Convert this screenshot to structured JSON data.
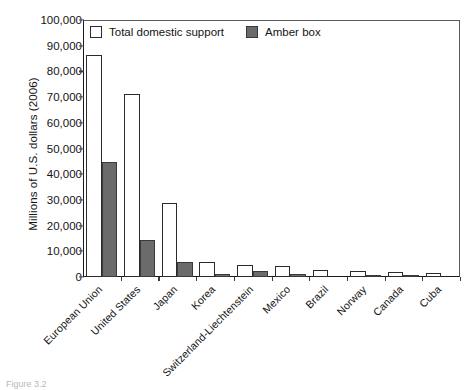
{
  "chart_data": {
    "type": "bar",
    "title": "",
    "xlabel": "",
    "ylabel": "Millions of U.S. dollars (2006)",
    "ylim": [
      0,
      100000
    ],
    "ytick_labels": [
      "100,000",
      "90,000",
      "80,000",
      "70,000",
      "60,000",
      "50,000",
      "40,000",
      "30,000",
      "20,000",
      "10,000",
      "0"
    ],
    "ytick_values": [
      100000,
      90000,
      80000,
      70000,
      60000,
      50000,
      40000,
      30000,
      20000,
      10000,
      0
    ],
    "grid": false,
    "legend_position": "top-left",
    "categories": [
      "European Union",
      "United States",
      "Japan",
      "Korea",
      "Switzerland-Liechtenstein",
      "Mexico",
      "Brazil",
      "Norway",
      "Canada",
      "Cuba"
    ],
    "series": [
      {
        "name": "Total domestic support",
        "color": "#ffffff",
        "values": [
          86500,
          71200,
          28900,
          6000,
          4800,
          4100,
          2900,
          2200,
          2000,
          1600
        ]
      },
      {
        "name": "Amber box",
        "color": "#6b6b6b",
        "values": [
          44700,
          14400,
          5900,
          1300,
          2200,
          1300,
          0,
          800,
          400,
          0
        ]
      }
    ]
  },
  "legend": {
    "items": [
      {
        "label": "Total domestic support",
        "swatch": "open-square-swatch"
      },
      {
        "label": "Amber box",
        "swatch": "filled-square-swatch"
      }
    ]
  },
  "caption": {
    "text": "Figure 3.2"
  }
}
